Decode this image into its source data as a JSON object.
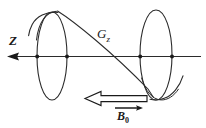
{
  "figure": {
    "background_color": "#ffffff",
    "ink_color": "#1a1a1a",
    "labels": {
      "axis_label": "Z",
      "gradient_label": "G",
      "gradient_subscript": "z",
      "field_label": "B",
      "field_subscript": "0"
    },
    "elements": {
      "axis_arrow": "z-axis-arrow-pointing-left",
      "left_loop": "precession-circle-left",
      "right_loop": "precession-circle-right",
      "helix": "magnetization-helix-line",
      "hollow_arrow": "b0-field-direction-hollow-arrow-left",
      "small_arrow": "b0-vector-small-arrow-right",
      "axis_dots": 4
    },
    "geometry": {
      "axis_y": 56,
      "axis_x_start": 8,
      "axis_x_end": 200,
      "left_ellipse_cx": 52,
      "left_ellipse_cy": 56,
      "left_ellipse_rx": 15,
      "left_ellipse_ry": 44,
      "right_ellipse_cx": 156,
      "right_ellipse_cy": 55,
      "right_ellipse_rx": 16,
      "right_ellipse_ry": 45,
      "dot_positions_x": [
        37,
        67,
        140,
        172
      ]
    }
  }
}
